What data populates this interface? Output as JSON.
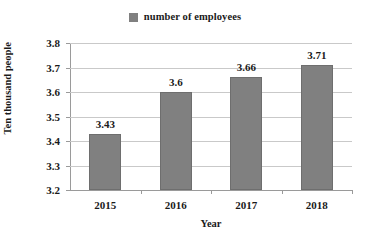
{
  "chart_data": {
    "type": "bar",
    "title": "",
    "categories": [
      "2015",
      "2016",
      "2017",
      "2018"
    ],
    "values": [
      3.43,
      3.6,
      3.66,
      3.71
    ],
    "value_labels": [
      "3.43",
      "3.6",
      "3.66",
      "3.71"
    ],
    "series": [
      {
        "name": "number of employees",
        "values": [
          3.43,
          3.6,
          3.66,
          3.71
        ]
      }
    ],
    "xlabel": "Year",
    "ylabel": "Ten thousand people",
    "ylim": [
      3.2,
      3.8
    ],
    "ytick_labels": [
      "3.2",
      "3.3",
      "3.4",
      "3.5",
      "3.6",
      "3.7",
      "3.8"
    ],
    "ytick_values": [
      3.2,
      3.3,
      3.4,
      3.5,
      3.6,
      3.7,
      3.8
    ],
    "grid": true,
    "legend_position": "top-center",
    "legend": [
      {
        "label": "number of employees",
        "color": "#808080",
        "swatch": "square-swatch-icon"
      }
    ],
    "bar_color": "#808080",
    "bar_border_color": "#6e6e6e",
    "gridline_color": "#c9c9c9",
    "axis_color": "#9a9a9a",
    "background_color": "#ffffff"
  }
}
